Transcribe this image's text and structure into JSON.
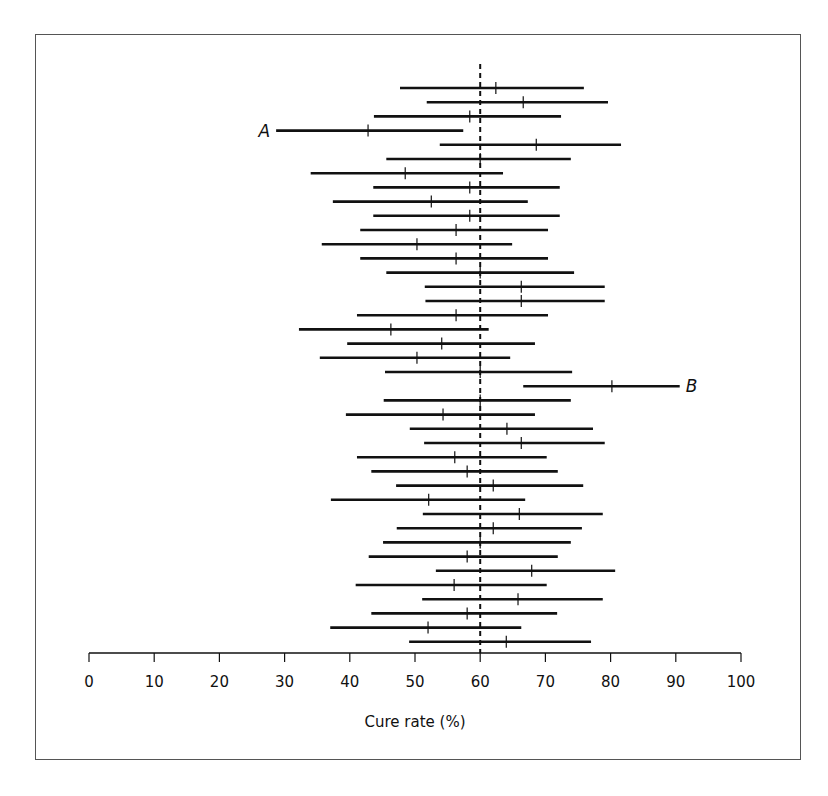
{
  "chart_data": {
    "type": "forest",
    "title": "",
    "xlabel": "Cure rate (%)",
    "ylabel": "",
    "xlim": [
      0,
      100
    ],
    "xticks": [
      0,
      10,
      20,
      30,
      40,
      50,
      60,
      70,
      80,
      90,
      100
    ],
    "reference_line": {
      "x": 60,
      "style": "dashed"
    },
    "grid": false,
    "legend": null,
    "annotations": [
      {
        "label": "A",
        "row": 4,
        "position": "left"
      },
      {
        "label": "B",
        "row": 22,
        "position": "right"
      }
    ],
    "rows": [
      {
        "lo": 47.7,
        "hi": 75.9,
        "est": 62.4
      },
      {
        "lo": 51.8,
        "hi": 79.6,
        "est": 66.6
      },
      {
        "lo": 43.7,
        "hi": 72.4,
        "est": 58.4
      },
      {
        "lo": 28.7,
        "hi": 57.4,
        "est": 42.8,
        "label": "A"
      },
      {
        "lo": 53.8,
        "hi": 81.6,
        "est": 68.6
      },
      {
        "lo": 45.6,
        "hi": 73.9,
        "est": 60.0
      },
      {
        "lo": 34.0,
        "hi": 63.5,
        "est": 48.5
      },
      {
        "lo": 43.6,
        "hi": 72.2,
        "est": 58.4
      },
      {
        "lo": 37.4,
        "hi": 67.3,
        "est": 52.5
      },
      {
        "lo": 43.6,
        "hi": 72.2,
        "est": 58.4
      },
      {
        "lo": 41.6,
        "hi": 70.4,
        "est": 56.3
      },
      {
        "lo": 35.7,
        "hi": 64.9,
        "est": 50.3
      },
      {
        "lo": 41.6,
        "hi": 70.4,
        "est": 56.3
      },
      {
        "lo": 45.6,
        "hi": 74.4,
        "est": 60.0
      },
      {
        "lo": 51.5,
        "hi": 79.1,
        "est": 66.3
      },
      {
        "lo": 51.6,
        "hi": 79.1,
        "est": 66.3
      },
      {
        "lo": 41.1,
        "hi": 70.4,
        "est": 56.3
      },
      {
        "lo": 32.2,
        "hi": 61.3,
        "est": 46.3
      },
      {
        "lo": 39.6,
        "hi": 68.4,
        "est": 54.1
      },
      {
        "lo": 35.4,
        "hi": 64.6,
        "est": 50.3
      },
      {
        "lo": 45.4,
        "hi": 74.1,
        "est": 60.0
      },
      {
        "lo": 66.6,
        "hi": 90.6,
        "est": 80.2,
        "label": "B"
      },
      {
        "lo": 45.2,
        "hi": 73.9,
        "est": 60.0
      },
      {
        "lo": 39.4,
        "hi": 68.4,
        "est": 54.3
      },
      {
        "lo": 49.2,
        "hi": 77.3,
        "est": 64.1
      },
      {
        "lo": 51.4,
        "hi": 79.1,
        "est": 66.3
      },
      {
        "lo": 41.1,
        "hi": 70.2,
        "est": 56.1
      },
      {
        "lo": 43.3,
        "hi": 71.9,
        "est": 58.0
      },
      {
        "lo": 47.1,
        "hi": 75.8,
        "est": 62.0
      },
      {
        "lo": 37.1,
        "hi": 66.9,
        "est": 52.1
      },
      {
        "lo": 51.2,
        "hi": 78.8,
        "est": 66.0
      },
      {
        "lo": 47.2,
        "hi": 75.6,
        "est": 62.0
      },
      {
        "lo": 45.1,
        "hi": 73.9,
        "est": 60.0
      },
      {
        "lo": 42.9,
        "hi": 71.9,
        "est": 58.0
      },
      {
        "lo": 53.2,
        "hi": 80.7,
        "est": 67.9
      },
      {
        "lo": 40.9,
        "hi": 70.2,
        "est": 56.0
      },
      {
        "lo": 51.1,
        "hi": 78.8,
        "est": 65.8
      },
      {
        "lo": 43.3,
        "hi": 71.8,
        "est": 58.0
      },
      {
        "lo": 37.0,
        "hi": 66.3,
        "est": 52.0
      },
      {
        "lo": 49.1,
        "hi": 77.0,
        "est": 64.0
      }
    ]
  },
  "style": {
    "line_color": "#111111",
    "ref_line_color": "#111111",
    "frame_color": "#555555",
    "background": "#ffffff"
  }
}
